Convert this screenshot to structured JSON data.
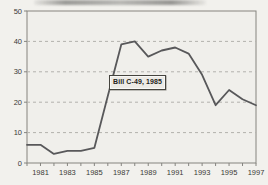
{
  "figure": {
    "kind": "scanned statistical line chart",
    "paper_color": "#f2f1ed",
    "plot_bg_color": "#f0efeb",
    "annotation": {
      "text": "Bill C-49, 1985"
    }
  },
  "chart_data": {
    "type": "line",
    "title": "",
    "xlabel": "",
    "ylabel": "",
    "x": [
      1980,
      1981,
      1982,
      1983,
      1984,
      1985,
      1986,
      1987,
      1988,
      1989,
      1990,
      1991,
      1992,
      1993,
      1994,
      1995,
      1996,
      1997
    ],
    "values": [
      6,
      6,
      3,
      4,
      4,
      5,
      22,
      39,
      40,
      35,
      37,
      38,
      36,
      29,
      19,
      24,
      21,
      19
    ],
    "xlim": [
      1980,
      1997
    ],
    "ylim": [
      0,
      50
    ],
    "y_ticks": [
      0,
      10,
      20,
      30,
      40,
      50
    ],
    "y_gridlines_dashed": [
      10,
      20,
      30,
      40
    ],
    "x_ticks_every_year": true,
    "x_tick_labels": [
      "1981",
      "1983",
      "1985",
      "1987",
      "1989",
      "1991",
      "1993",
      "1995",
      "1997"
    ],
    "legend": "none",
    "annotation": {
      "text": "Bill C-49, 1985",
      "anchor_year": 1985
    },
    "line_color": "#58585a",
    "grid_color": "#b2b1ad",
    "frame_color": "#85847f",
    "text_color": "#3a3a36"
  }
}
